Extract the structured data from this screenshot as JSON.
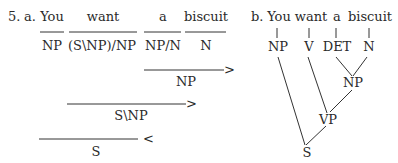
{
  "example_number": "5.",
  "part_a": {
    "label": "a.",
    "words": [
      "You",
      "want",
      "a",
      "biscuit"
    ],
    "categories": [
      "NP",
      "(S\\NP)/NP",
      "NP/N",
      "N"
    ],
    "derivations": [
      {
        "result": "NP",
        "rule": ">"
      },
      {
        "result": "S\\NP",
        "rule": ">"
      },
      {
        "result": "S",
        "rule": "<"
      }
    ]
  },
  "part_b": {
    "label": "b.",
    "words": [
      "You",
      "want",
      "a",
      "biscuit"
    ],
    "preterminals": [
      "NP",
      "V",
      "DET",
      "N"
    ],
    "nodes": {
      "np": "NP",
      "vp": "VP",
      "s": "S"
    }
  }
}
